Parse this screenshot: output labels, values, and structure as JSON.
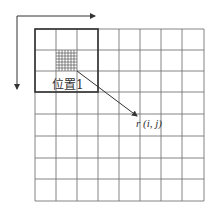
{
  "diagram": {
    "type": "grid-window-diagram",
    "grid": {
      "columns": 8,
      "rows": 8,
      "x0": 35,
      "y0": 29,
      "cell": 21.2
    },
    "highlight_window": {
      "columns": 3,
      "rows": 3,
      "line": "thick"
    },
    "fine_cell": {
      "column": 1,
      "row": 1,
      "subdivisions": 7
    },
    "axes": {
      "horizontal_arrow": "x-direction",
      "vertical_arrow": "y-direction"
    },
    "labels": {
      "position": "位置1",
      "result": "r (i, j)"
    },
    "colors": {
      "line": "#555555",
      "thick_line": "#333333",
      "background": "#ffffff"
    }
  }
}
